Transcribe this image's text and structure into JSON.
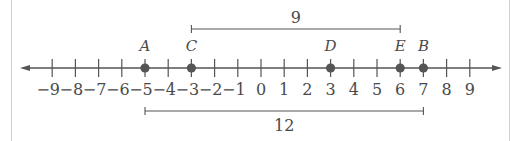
{
  "number_line": {
    "min": -9,
    "max": 9,
    "tick_labels": [
      "−9",
      "−8",
      "−7",
      "−6",
      "−5",
      "−4",
      "−3",
      "−2",
      "−1",
      "0",
      "1",
      "2",
      "3",
      "4",
      "5",
      "6",
      "7",
      "8",
      "9"
    ],
    "points": [
      {
        "label": "A",
        "value": -5
      },
      {
        "label": "C",
        "value": -3
      },
      {
        "label": "D",
        "value": 3
      },
      {
        "label": "E",
        "value": 6
      },
      {
        "label": "B",
        "value": 7
      }
    ],
    "brackets": [
      {
        "from": -3,
        "to": 6,
        "label": "9",
        "position": "above"
      },
      {
        "from": -5,
        "to": 7,
        "label": "12",
        "position": "below"
      }
    ]
  },
  "colors": {
    "line": "#555555",
    "point": "#555555",
    "text": "#4a4a4a",
    "frame": "#cfcfcf"
  }
}
